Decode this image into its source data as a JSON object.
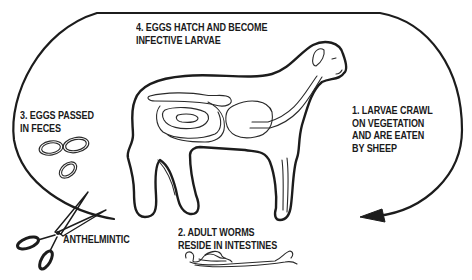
{
  "diagram": {
    "type": "life-cycle",
    "colors": {
      "ink": "#1c1c1c",
      "background": "#ffffff"
    },
    "stages": [
      {
        "number": "1",
        "lines": [
          "1. LARVAE CRAWL",
          "ON VEGETATION",
          "AND ARE EATEN",
          "BY SHEEP"
        ]
      },
      {
        "number": "2",
        "lines": [
          "2. ADULT WORMS",
          "RESIDE IN INTESTINES"
        ]
      },
      {
        "number": "3",
        "lines": [
          "3. EGGS PASSED",
          "IN FECES"
        ]
      },
      {
        "number": "4",
        "lines": [
          "4. EGGS HATCH AND BECOME",
          "INFECTIVE LARVAE"
        ]
      }
    ],
    "intervention": {
      "label": "ANTHELMINTIC",
      "icon": "scissors-icon"
    },
    "icons": {
      "sheep": "sheep-illustration",
      "eggs": "eggs-icon",
      "worms": "worms-icon",
      "cycle_arrow": "cycle-arrow"
    }
  }
}
